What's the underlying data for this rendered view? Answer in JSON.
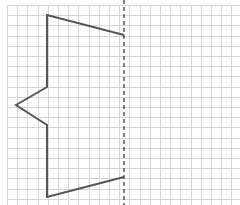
{
  "diagram": {
    "type": "symmetry-grid",
    "grid": {
      "origin_x": 7,
      "origin_y": 5,
      "spacing": 10.2,
      "columns": 23,
      "rows": 20,
      "color": "#d6d6d6"
    },
    "mirror_line": {
      "x": 124,
      "style": "dashed",
      "color": "#555555"
    },
    "shape": {
      "stroke": "#555555",
      "stroke_width": 2,
      "points": [
        [
          124,
          35
        ],
        [
          47,
          15
        ],
        [
          47,
          87
        ],
        [
          16,
          105
        ],
        [
          47,
          125
        ],
        [
          47,
          197
        ],
        [
          124,
          177
        ]
      ]
    },
    "colors": {
      "background": "#ffffff"
    }
  }
}
